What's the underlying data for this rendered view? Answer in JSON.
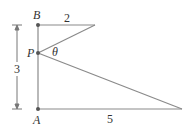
{
  "diagram": {
    "points": {
      "B": {
        "label": "B"
      },
      "P": {
        "label": "P"
      },
      "A": {
        "label": "A"
      }
    },
    "labels": {
      "top_length": "2",
      "bottom_length": "5",
      "vertical_length": "3",
      "angle": "θ"
    },
    "colors": {
      "line": "#8a8a8a",
      "point": "#555555",
      "text": "#333333"
    }
  }
}
